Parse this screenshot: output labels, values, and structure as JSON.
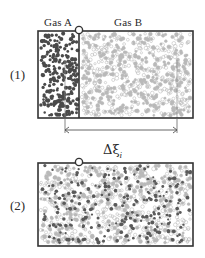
{
  "figure": {
    "type": "diagram",
    "background_color": "#ffffff",
    "line_color": "#333333"
  },
  "labels": {
    "gas_a": "Gas A",
    "gas_b": "Gas B",
    "panel_one": "(1)",
    "panel_two": "(2)",
    "dimension_delta": "Δ",
    "dimension_xi": "ξ",
    "dimension_subscript": "i"
  },
  "panels": [
    {
      "id": "panel-1",
      "number": "(1)",
      "box": {
        "x": 38,
        "y": 31,
        "width": 155,
        "height": 87
      },
      "partition": {
        "x": 79,
        "y_top": 31,
        "y_bottom": 118,
        "state": "closed"
      },
      "stopcock": {
        "cx": 79,
        "cy": 30,
        "r": 3.6,
        "fill": "#ffffff",
        "stroke": "#333333"
      },
      "regions": [
        {
          "name": "gas-a-region",
          "label": "Gas A",
          "x": 39,
          "y": 32,
          "width": 40,
          "height": 85,
          "particle_count": 230,
          "particle_color": "#4a4a4a",
          "particle_style": "filled",
          "particle_size": 1.9
        },
        {
          "name": "gas-b-region",
          "label": "Gas B",
          "x": 80,
          "y": 32,
          "width": 112,
          "height": 85,
          "particle_count": 700,
          "particle_color": "#b9b9b9",
          "particle_style": "open",
          "particle_size": 1.7
        }
      ]
    },
    {
      "id": "panel-2",
      "number": "(2)",
      "box": {
        "x": 38,
        "y": 163,
        "width": 155,
        "height": 83
      },
      "partition": {
        "x": 79,
        "state": "removed"
      },
      "stopcock": {
        "cx": 79,
        "cy": 162,
        "r": 3.6,
        "fill": "#ffffff",
        "stroke": "#333333"
      },
      "regions": [
        {
          "name": "mixed-gas-region",
          "label": "Gas A + Gas B mixed",
          "x": 39,
          "y": 164,
          "width": 153,
          "height": 81,
          "particle_count_a": 250,
          "particle_count_b": 700,
          "particle_color_a": "#5a5a5a",
          "particle_color_b": "#b9b9b9",
          "particle_size": 1.8
        }
      ]
    }
  ],
  "dimension": {
    "name": "delta-xi-i",
    "text_delta": "Δ",
    "text_xi": "ξ",
    "text_sub": "i",
    "line_y": 130,
    "x_start": 65,
    "x_end": 177,
    "extension_top_left_y": 60,
    "extension_top_right_y": 60,
    "arrow_size": 4,
    "color": "#555555"
  },
  "text_positions": {
    "gas_a": {
      "x": 44,
      "y": 17
    },
    "gas_b": {
      "x": 114,
      "y": 17
    },
    "panel_one": {
      "x": 10,
      "y": 68
    },
    "panel_two": {
      "x": 10,
      "y": 199
    },
    "dim_label": {
      "x": 103,
      "y": 143
    }
  }
}
